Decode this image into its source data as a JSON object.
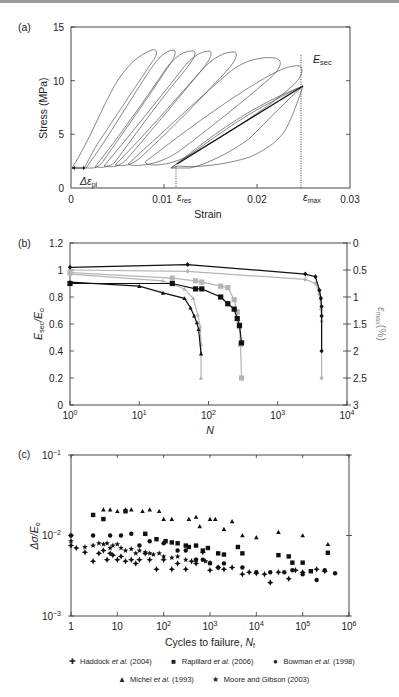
{
  "chart_data": [
    {
      "panel": "(a)",
      "type": "line",
      "title": "",
      "xlabel": "Strain",
      "ylabel": "Stress (MPa)",
      "xlim": [
        0,
        0.03
      ],
      "ylim": [
        0,
        15
      ],
      "xticks": [
        "0",
        "0.01",
        "0.02",
        "0.03"
      ],
      "yticks": [
        "0",
        "5",
        "10",
        "15"
      ],
      "annotations": [
        "E_sec",
        "Δε_pl",
        "ε_res",
        "ε_max"
      ],
      "series": [
        {
          "name": "loop 1",
          "start_strain": 0.0,
          "peak_strain": 0.0085,
          "peak_stress": 12.8
        },
        {
          "name": "loop 2",
          "start_strain": 0.0015,
          "peak_strain": 0.0105,
          "peak_stress": 12.8
        },
        {
          "name": "loop 3",
          "start_strain": 0.0025,
          "peak_strain": 0.012,
          "peak_stress": 12.7
        },
        {
          "name": "loop 4",
          "start_strain": 0.0035,
          "peak_strain": 0.0135,
          "peak_stress": 12.7
        },
        {
          "name": "loop 5",
          "start_strain": 0.0045,
          "peak_strain": 0.0155,
          "peak_stress": 12.6
        },
        {
          "name": "loop 6",
          "start_strain": 0.006,
          "peak_strain": 0.0185,
          "peak_stress": 12.4
        },
        {
          "name": "loop 7",
          "start_strain": 0.0075,
          "peak_strain": 0.0225,
          "peak_stress": 12.2
        },
        {
          "name": "final loop",
          "start_strain": 0.0105,
          "peak_strain": 0.0248,
          "peak_stress": 11.9
        }
      ],
      "secant": {
        "x": [
          0.0112,
          0.0248
        ],
        "y": [
          2.1,
          11.9
        ]
      },
      "eps_res": 0.0112,
      "eps_max": 0.0248,
      "min_stress": 1.8
    },
    {
      "panel": "(b)",
      "type": "line",
      "xlabel": "N",
      "ylabel": "E_sec/E_o",
      "ylabel_right": "ε_max (%)",
      "xscale": "log",
      "xlim": [
        1,
        10000
      ],
      "ylim": [
        0,
        1.2
      ],
      "ylim_right": [
        3,
        0
      ],
      "xticks": [
        "10^0",
        "10^1",
        "10^2",
        "10^3",
        "10^4"
      ],
      "yticks": [
        "0",
        "0.2",
        "0.4",
        "0.6",
        "0.8",
        "1",
        "1.2"
      ],
      "yticks_right": [
        "0",
        "0.5",
        "1",
        "1.5",
        "2",
        "2.5",
        "3"
      ],
      "series": [
        {
          "name": "E_sec/E_o triangles (black)",
          "marker": "triangle",
          "color": "#111111",
          "x": [
            1,
            10,
            22,
            45,
            55,
            62,
            68,
            72,
            78
          ],
          "y": [
            0.91,
            0.88,
            0.83,
            0.79,
            0.72,
            0.66,
            0.61,
            0.56,
            0.38
          ]
        },
        {
          "name": "ε_max triangles (grey)",
          "marker": "triangle",
          "color": "#b5b5b5",
          "x": [
            1,
            22,
            45,
            60,
            70,
            76,
            78,
            78
          ],
          "y": [
            0.97,
            0.92,
            0.86,
            0.79,
            0.67,
            0.58,
            0.45,
            0.2
          ]
        },
        {
          "name": "E_sec/E_o squares (black)",
          "marker": "square",
          "color": "#111111",
          "x": [
            1,
            30,
            65,
            80,
            150,
            190,
            235,
            260,
            280,
            300
          ],
          "y": [
            0.9,
            0.9,
            0.86,
            0.86,
            0.8,
            0.75,
            0.71,
            0.64,
            0.59,
            0.46
          ]
        },
        {
          "name": "ε_max squares (grey)",
          "marker": "square",
          "color": "#b5b5b5",
          "x": [
            1,
            30,
            65,
            80,
            150,
            190,
            235,
            260,
            280,
            290,
            300
          ],
          "y": [
            0.98,
            0.94,
            0.92,
            0.91,
            0.88,
            0.87,
            0.78,
            0.69,
            0.58,
            0.45,
            0.2
          ]
        },
        {
          "name": "E_sec/E_o diamonds (black)",
          "marker": "diamond",
          "color": "#111111",
          "x": [
            1,
            50,
            2500,
            3500,
            4000,
            4200,
            4300,
            4300,
            4300
          ],
          "y": [
            1.02,
            1.04,
            0.97,
            0.95,
            0.85,
            0.79,
            0.73,
            0.66,
            0.4
          ]
        },
        {
          "name": "ε_max diamonds (grey)",
          "marker": "diamond",
          "color": "#b5b5b5",
          "x": [
            1,
            50,
            2500,
            3500,
            4000,
            4200,
            4300,
            4300
          ],
          "y": [
            1.0,
            0.99,
            0.93,
            0.9,
            0.82,
            0.71,
            0.62,
            0.2
          ]
        }
      ]
    },
    {
      "panel": "(c)",
      "type": "scatter",
      "xlabel": "Cycles to failure, N_f",
      "ylabel": "Δσ/E_o",
      "xscale": "log",
      "yscale": "log",
      "xlim": [
        1,
        1000000
      ],
      "ylim": [
        0.001,
        0.1
      ],
      "xticks": [
        "1",
        "10",
        "10^2",
        "10^3",
        "10^4",
        "10^5",
        "10^6"
      ],
      "yticks": [
        "10^-3",
        "10^-2",
        "10^-1"
      ],
      "legend_position": "bottom",
      "series": [
        {
          "name": "Haddock et al. (2004)",
          "marker": "plus4",
          "x": [
            1,
            1.3,
            2,
            3,
            4,
            5,
            6,
            7,
            8,
            10,
            12,
            15,
            20,
            25,
            30,
            40,
            50,
            70,
            100,
            150,
            200,
            300,
            400,
            500,
            700,
            1000,
            1500,
            2000,
            3000,
            5000,
            7000,
            10000,
            15000,
            20000,
            30000,
            50000,
            70000,
            100000,
            200000,
            300000
          ],
          "y": [
            0.0075,
            0.007,
            0.0062,
            0.0048,
            0.006,
            0.0065,
            0.005,
            0.006,
            0.0057,
            0.005,
            0.0055,
            0.0048,
            0.005,
            0.0045,
            0.005,
            0.006,
            0.005,
            0.0038,
            0.005,
            0.0038,
            0.0045,
            0.0038,
            0.0048,
            0.0045,
            0.0062,
            0.0037,
            0.004,
            0.0038,
            0.004,
            0.0033,
            0.0035,
            0.0034,
            0.0033,
            0.0026,
            0.0035,
            0.0029,
            0.0037,
            0.0035,
            0.0038,
            0.0036
          ]
        },
        {
          "name": "Rapillard et al. (2006)",
          "marker": "square",
          "x": [
            3,
            5,
            15,
            40,
            70,
            110,
            150,
            200,
            300,
            350,
            500,
            700,
            900,
            1500,
            2000,
            4000,
            5000,
            30000,
            50000,
            60000,
            100000,
            150000,
            350000
          ],
          "y": [
            0.018,
            0.016,
            0.02,
            0.0105,
            0.009,
            0.0085,
            0.0082,
            0.008,
            0.0075,
            0.0072,
            0.0075,
            0.0065,
            0.007,
            0.006,
            0.0058,
            0.0072,
            0.006,
            0.0057,
            0.0055,
            0.0046,
            0.0046,
            0.0036,
            0.0061
          ]
        },
        {
          "name": "Bowman et al. (1998)",
          "marker": "circle",
          "x": [
            1,
            3,
            7,
            12,
            20,
            30,
            50,
            100,
            200,
            300,
            500,
            700,
            1000,
            1500,
            2000,
            5000,
            10000,
            20000,
            40000,
            60000,
            100000,
            200000,
            300000,
            500000
          ],
          "y": [
            0.01,
            0.01,
            0.01,
            0.01,
            0.0105,
            0.0075,
            0.0085,
            0.008,
            0.0065,
            0.0065,
            0.005,
            0.005,
            0.0045,
            0.004,
            0.0045,
            0.004,
            0.0035,
            0.0035,
            0.0035,
            0.0037,
            0.0033,
            0.0028,
            0.0037,
            0.0034
          ]
        },
        {
          "name": "Michel et al. (1993)",
          "marker": "triangle",
          "x": [
            5,
            7,
            10,
            15,
            20,
            35,
            50,
            80,
            100,
            150,
            350,
            500,
            600,
            1000,
            1300,
            2000,
            3000,
            5000,
            10000,
            30000,
            100000,
            350000
          ],
          "y": [
            0.021,
            0.021,
            0.02,
            0.021,
            0.021,
            0.02,
            0.021,
            0.02,
            0.016,
            0.016,
            0.016,
            0.017,
            0.013,
            0.016,
            0.016,
            0.012,
            0.015,
            0.01,
            0.0095,
            0.011,
            0.01,
            0.0078
          ]
        },
        {
          "name": "Moore and Gibson (2003)",
          "marker": "star",
          "x": [
            1,
            2,
            3,
            4,
            5,
            6,
            7,
            8,
            10,
            12,
            15,
            20,
            25,
            30,
            40,
            50,
            60,
            80,
            100,
            150,
            200,
            300,
            500,
            800,
            1000
          ],
          "y": [
            0.0085,
            0.0072,
            0.0075,
            0.008,
            0.0078,
            0.008,
            0.007,
            0.0075,
            0.0078,
            0.007,
            0.0065,
            0.0068,
            0.006,
            0.0065,
            0.0062,
            0.006,
            0.0058,
            0.006,
            0.0055,
            0.0053,
            0.0055,
            0.005,
            0.005,
            0.0048,
            0.0046
          ]
        }
      ]
    }
  ],
  "panel_labels": {
    "a": "(a)",
    "b": "(b)",
    "c": "(c)"
  },
  "panel_a": {
    "ylabel": "Stress (MPa)",
    "xlabel": "Strain",
    "yticks": [
      "15",
      "10",
      "5",
      "0"
    ],
    "xticks": [
      "0",
      "0.01",
      "0.02",
      "0.03"
    ],
    "esec": "E",
    "esec_sub": "sec",
    "dpl": "Δε",
    "dpl_sub": "pl",
    "eres": "ε",
    "eres_sub": "res",
    "emax": "ε",
    "emax_sub": "max"
  },
  "panel_b": {
    "ylabel_main": "E",
    "ylabel_sub1": "sec",
    "ylabel_mid": "/E",
    "ylabel_sub2": "o",
    "ylabel_right": "ε",
    "ylabel_right_sub": "max",
    "ylabel_right_unit": "(%)",
    "xlabel": "N",
    "yticks": [
      "1.2",
      "1",
      "0.8",
      "0.6",
      "0.4",
      "0.2",
      "0"
    ],
    "yticks_right": [
      "0",
      "0.5",
      "1",
      "1.5",
      "2",
      "2.5",
      "3"
    ],
    "xticks_base": [
      "10",
      "10",
      "10",
      "10",
      "10"
    ],
    "xticks_exp": [
      "0",
      "1",
      "2",
      "3",
      "4"
    ]
  },
  "panel_c": {
    "ylabel": "Δσ/E",
    "ylabel_sub": "o",
    "xlabel": "Cycles to failure, ",
    "xlabel_var": "N",
    "xlabel_sub": "f",
    "yticks_base": [
      "10",
      "10",
      "10"
    ],
    "yticks_exp": [
      "−1",
      "−2",
      "−3"
    ],
    "xticks": [
      "1",
      "10",
      "10",
      "10",
      "10",
      "10",
      "10"
    ],
    "xticks_exp": [
      "",
      "",
      "2",
      "3",
      "4",
      "5",
      "6"
    ]
  },
  "legend": {
    "items": [
      {
        "symbol": "✚",
        "pre": "Haddock ",
        "etal": "et al.",
        "post": " (2004)"
      },
      {
        "symbol": "■",
        "pre": "Rapillard ",
        "etal": "et al.",
        "post": " (2006)"
      },
      {
        "symbol": "●",
        "pre": "Bowman ",
        "etal": "et al.",
        "post": " (1998)"
      },
      {
        "symbol": "▲",
        "pre": "Michel ",
        "etal": "et al.",
        "post": " (1993)"
      },
      {
        "symbol": "★",
        "pre": "Moore and Gibson (2003)",
        "etal": "",
        "post": ""
      }
    ]
  }
}
